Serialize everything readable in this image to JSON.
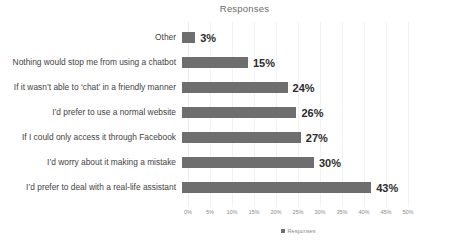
{
  "chart_data": {
    "type": "bar",
    "orientation": "horizontal",
    "title": "Responses",
    "xlabel": "",
    "ylabel": "",
    "xlim": [
      0,
      50
    ],
    "grid": true,
    "legend_position": "bottom",
    "categories": [
      "Other",
      "Nothing would stop me from using a chatbot",
      "If it wasn’t able to ‘chat’ in a friendly manner",
      "I’d prefer to use a normal website",
      "If I could only access it through Facebook",
      "I’d worry about it making a mistake",
      "I’d prefer to deal with a real-life assistant"
    ],
    "values": [
      3,
      15,
      24,
      26,
      27,
      30,
      43
    ],
    "data_labels": [
      "3%",
      "15%",
      "24%",
      "26%",
      "27%",
      "30%",
      "43%"
    ],
    "tick_labels": [
      "0%",
      "5%",
      "10%",
      "15%",
      "20%",
      "25%",
      "30%",
      "35%",
      "40%",
      "45%",
      "50%"
    ],
    "tick_values": [
      0,
      5,
      10,
      15,
      20,
      25,
      30,
      35,
      40,
      45,
      50
    ],
    "series": [
      {
        "name": "Responses",
        "values": [
          3,
          15,
          24,
          26,
          27,
          30,
          43
        ]
      }
    ],
    "legend": [
      "Responses"
    ],
    "colors": {
      "bar": "#6e6e6e",
      "gridline": "#f2f2f2",
      "background": "#ffffff",
      "label_text": "#3f3f3f",
      "value_text": "#2b2b2b",
      "tick_text": "#8c8c8c",
      "title_text": "#6b6b6b"
    }
  }
}
